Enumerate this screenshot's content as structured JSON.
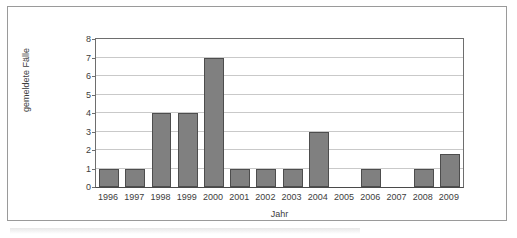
{
  "chart_data": {
    "type": "bar",
    "title": "",
    "xlabel": "Jahr",
    "ylabel": "gemeldete Fälle",
    "categories": [
      "1996",
      "1997",
      "1998",
      "1999",
      "2000",
      "2001",
      "2002",
      "2003",
      "2004",
      "2005",
      "2006",
      "2007",
      "2008",
      "2009"
    ],
    "values": [
      1,
      1,
      4,
      4,
      7,
      1,
      1,
      1,
      3,
      0,
      1,
      0,
      1,
      1.8
    ],
    "ylim": [
      0,
      8
    ],
    "yticks": [
      "0",
      "1",
      "2",
      "3",
      "4",
      "5",
      "6",
      "7",
      "8"
    ],
    "ytick_values": [
      0,
      1,
      2,
      3,
      4,
      5,
      6,
      7,
      8
    ],
    "grid": "horizontal",
    "legend": "none",
    "bar_color": "#808080",
    "bar_edge_color": "#4d4d4d",
    "gridline_color": "#c9c9c9",
    "axis_color": "#6e6e6e",
    "text_color": "#3d3d3d",
    "background": "#ffffff"
  }
}
